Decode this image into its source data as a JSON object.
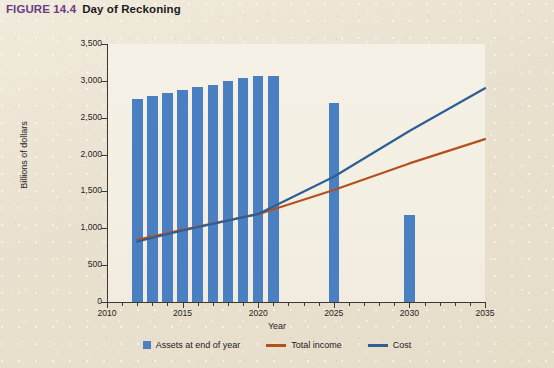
{
  "figure": {
    "label": "FIGURE 14.4",
    "title": "Day of Reckoning"
  },
  "legend": {
    "items": [
      {
        "label": "Assets at end of year",
        "marker": "box",
        "color": "#4a7fc1"
      },
      {
        "label": "Total income",
        "marker": "line",
        "color": "#b4501e"
      },
      {
        "label": "Cost",
        "marker": "line",
        "color": "#2e5f94"
      }
    ]
  },
  "colors": {
    "bar": "#4a7fc1",
    "total_income": "#b4501e",
    "cost": "#2e5f94",
    "figure_label": "#6b3b86",
    "background": "#ece5d5",
    "plot_background": "#f4efe3",
    "axis": "#3c3a35"
  },
  "chart_data": {
    "type": "bar",
    "title": "Day of Reckoning",
    "xlabel": "Year",
    "ylabel": "Billions of dollars",
    "xlim": [
      2010,
      2035
    ],
    "ylim": [
      0,
      3500
    ],
    "ytick_labels": [
      "0",
      "500",
      "1,000",
      "1,500",
      "2,000",
      "2,500",
      "3,000",
      "3,500"
    ],
    "ytick_values": [
      0,
      500,
      1000,
      1500,
      2000,
      2500,
      3000,
      3500
    ],
    "xtick_labels": [
      "2010",
      "2015",
      "2020",
      "2025",
      "2030",
      "2035"
    ],
    "xtick_values": [
      2010,
      2015,
      2020,
      2025,
      2030,
      2035
    ],
    "grid": false,
    "legend_position": "bottom",
    "series": [
      {
        "name": "Assets at end of year",
        "type": "bar",
        "color": "#4a7fc1",
        "x": [
          2012,
          2013,
          2014,
          2015,
          2016,
          2017,
          2018,
          2019,
          2020,
          2021,
          2025,
          2030
        ],
        "values": [
          2750,
          2790,
          2840,
          2870,
          2910,
          2950,
          3000,
          3040,
          3060,
          3060,
          2700,
          1180
        ]
      },
      {
        "name": "Total income",
        "type": "line",
        "color": "#b4501e",
        "x": [
          2012,
          2015,
          2020,
          2025,
          2030,
          2035
        ],
        "values": [
          845,
          980,
          1190,
          1520,
          1880,
          2210
        ]
      },
      {
        "name": "Cost",
        "type": "line",
        "color": "#2e5f94",
        "x": [
          2012,
          2015,
          2020,
          2025,
          2030,
          2035
        ],
        "values": [
          820,
          970,
          1195,
          1700,
          2320,
          2900
        ]
      }
    ]
  }
}
